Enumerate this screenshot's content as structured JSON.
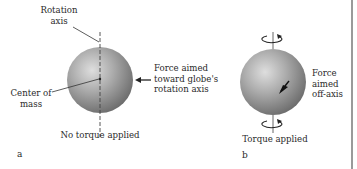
{
  "panels": [
    {
      "id": "a",
      "letter": "a",
      "labels": {
        "rotation_axis_line1": "Rotation",
        "rotation_axis_line2": "axis",
        "force_line1": "Force aimed",
        "force_line2": "toward globe's",
        "force_line3": "rotation axis",
        "center_line1": "Center of",
        "center_line2": "mass",
        "caption": "No torque applied"
      }
    },
    {
      "id": "b",
      "letter": "b",
      "labels": {
        "force_line1": "Force",
        "force_line2": "aimed",
        "force_line3": "off-axis",
        "caption": "Torque applied"
      }
    }
  ],
  "colors": {
    "globe_light": "#d9d9d9",
    "globe_mid": "#a8a8a8",
    "globe_dark": "#6e6e6e",
    "line": "#333333",
    "edge": "#9a9a9a"
  }
}
